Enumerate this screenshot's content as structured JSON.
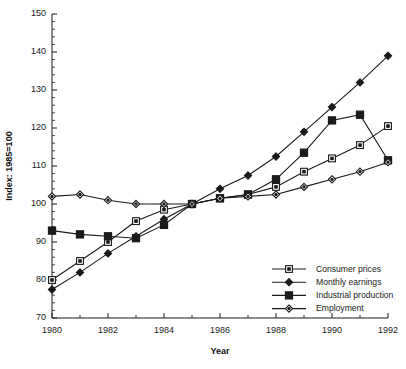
{
  "chart_data": {
    "type": "line",
    "title": "",
    "xlabel": "Year",
    "ylabel": "Index: 1985=100",
    "x": [
      1980,
      1981,
      1982,
      1983,
      1984,
      1985,
      1986,
      1987,
      1988,
      1989,
      1990,
      1991,
      1992
    ],
    "xlim": [
      1980,
      1992
    ],
    "ylim": [
      70,
      150
    ],
    "y_ticks": [
      70,
      80,
      90,
      100,
      110,
      120,
      130,
      140,
      150
    ],
    "x_ticks": [
      1980,
      1982,
      1984,
      1986,
      1988,
      1990,
      1992
    ],
    "y_minor_step": 2,
    "grid": false,
    "legend_position": "bottom-right",
    "series": [
      {
        "name": "Consumer prices",
        "marker": "open-square",
        "values": [
          80.0,
          85.0,
          90.0,
          95.5,
          98.5,
          100.0,
          101.5,
          102.5,
          104.5,
          108.5,
          112.0,
          115.5,
          120.5
        ]
      },
      {
        "name": "Monthly earnings",
        "marker": "filled-diamond",
        "values": [
          77.5,
          82.0,
          87.0,
          91.5,
          96.0,
          100.0,
          104.0,
          107.5,
          112.5,
          119.0,
          125.5,
          132.0,
          139.0
        ]
      },
      {
        "name": "Industrial production",
        "marker": "filled-square",
        "values": [
          93.0,
          92.0,
          91.5,
          91.0,
          94.5,
          100.0,
          101.5,
          102.5,
          106.5,
          113.5,
          122.0,
          123.5,
          111.5
        ]
      },
      {
        "name": "Employment",
        "marker": "open-diamond",
        "values": [
          102.0,
          102.5,
          101.0,
          100.0,
          100.0,
          100.0,
          101.5,
          102.0,
          102.5,
          104.5,
          106.5,
          108.5,
          111.0
        ]
      }
    ]
  }
}
